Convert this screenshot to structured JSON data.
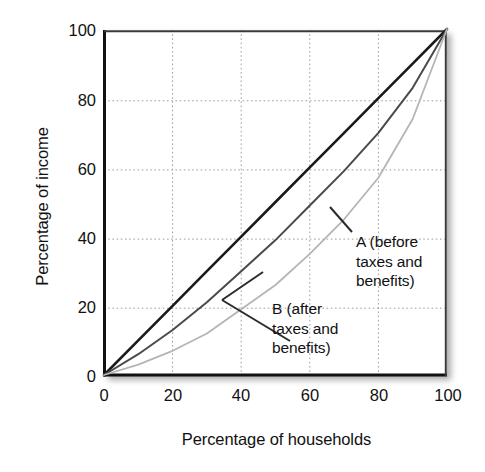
{
  "chart_data": {
    "type": "line",
    "title": "",
    "xlabel": "Percentage of households",
    "ylabel": "Percentage of income",
    "xlim": [
      0,
      100
    ],
    "ylim": [
      0,
      100
    ],
    "xticks": [
      "0",
      "20",
      "40",
      "60",
      "80",
      "100"
    ],
    "yticks": [
      "0",
      "20",
      "40",
      "60",
      "80",
      "100"
    ],
    "xtick_values": [
      0,
      20,
      40,
      60,
      80,
      100
    ],
    "ytick_values": [
      0,
      20,
      40,
      60,
      80,
      100
    ],
    "grid": true,
    "grid_style": "dotted",
    "legend_position": "inline-annotations",
    "x": [
      0,
      10,
      20,
      30,
      40,
      50,
      60,
      70,
      80,
      90,
      100
    ],
    "series": [
      {
        "name": "Line of equality",
        "label": "",
        "color": "#1a1a1a",
        "width": 2.6,
        "values": [
          0,
          10,
          20,
          30,
          40,
          50,
          60,
          70,
          80,
          90,
          100
        ]
      },
      {
        "name": "A (before taxes and benefits)",
        "label": "A (before taxes and benefits)",
        "color": "#4a4a4a",
        "width": 2.0,
        "values": [
          0,
          6,
          13,
          21,
          30,
          39,
          49,
          59,
          70,
          83,
          100
        ]
      },
      {
        "name": "B (after taxes and benefits)",
        "label": "B (after taxes and benefits)",
        "color": "#b5b5b5",
        "width": 1.8,
        "values": [
          0,
          3,
          7,
          12,
          19,
          26,
          35,
          45,
          57,
          74,
          100
        ]
      }
    ],
    "annotations": [
      {
        "id": "annot-a",
        "lines": [
          "A (before",
          "taxes and",
          "benefits)"
        ],
        "target_series": "A (before taxes and benefits)"
      },
      {
        "id": "annot-b",
        "lines": [
          "B (after",
          "taxes and",
          "benefits)"
        ],
        "target_series": "B (after taxes and benefits)"
      }
    ]
  },
  "axes": {
    "y_label": "Percentage of income",
    "x_label": "Percentage of households",
    "y_ticks": [
      {
        "label": "100"
      },
      {
        "label": "80"
      },
      {
        "label": "60"
      },
      {
        "label": "40"
      },
      {
        "label": "20"
      },
      {
        "label": "0"
      }
    ],
    "x_ticks": [
      {
        "label": "0"
      },
      {
        "label": "20"
      },
      {
        "label": "40"
      },
      {
        "label": "60"
      },
      {
        "label": "80"
      },
      {
        "label": "100"
      }
    ]
  },
  "annotations": {
    "a": {
      "line1": "A (before",
      "line2": "taxes and",
      "line3": "benefits)"
    },
    "b": {
      "line1": "B (after",
      "line2": "taxes and",
      "line3": "benefits)"
    }
  },
  "colors": {
    "equality_line": "#1a1a1a",
    "curve_a": "#4a4a4a",
    "curve_b": "#b5b5b5",
    "axis": "#111111",
    "grid": "#9a9a9a",
    "background": "#ffffff"
  }
}
